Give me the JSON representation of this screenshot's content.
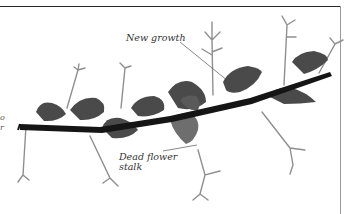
{
  "figure": {
    "labels": {
      "new_growth": "New growth",
      "dead_flower_stalk_line1": "Dead flower",
      "dead_flower_stalk_line2": "stalk"
    },
    "left_edge_partial_text": [
      "o",
      "r"
    ]
  },
  "colors": {
    "stem": "#151515",
    "leaf": "#4a4a4a",
    "leaf_light": "#777777",
    "stalk": "#8a8a8a",
    "leader_line": "#555555",
    "frame": "#2a2a2a"
  }
}
